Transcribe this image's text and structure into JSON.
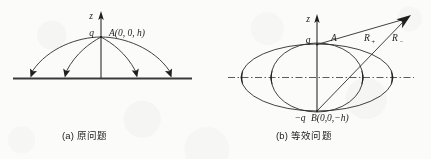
{
  "figure": {
    "background_color": "#fbfbfa",
    "ink_color": "#2c2c2c",
    "panels": [
      {
        "id": "panel-a",
        "caption": "(a) 原问题",
        "axis_label": "z",
        "charge_label": "q",
        "point_label": "A(0, 0, h)",
        "ground_line": "solid horizontal conducting plane",
        "field_line_count": 4,
        "field_line_arrow_direction": "into the plane"
      },
      {
        "id": "panel-b",
        "caption": "(b) 等效问题",
        "axis_label": "z",
        "charge_label_positive": "q",
        "point_label_positive": "A",
        "charge_label_negative": "−q",
        "point_label_negative": "B(0,0,−h)",
        "distance_label_positive": "R",
        "distance_subscript_positive": "+",
        "distance_label_negative": "R",
        "distance_subscript_negative": "−",
        "axis_line": "dash-dot horizontal symmetry axis",
        "ellipse_count": 2,
        "arrow_count": 2
      }
    ]
  }
}
